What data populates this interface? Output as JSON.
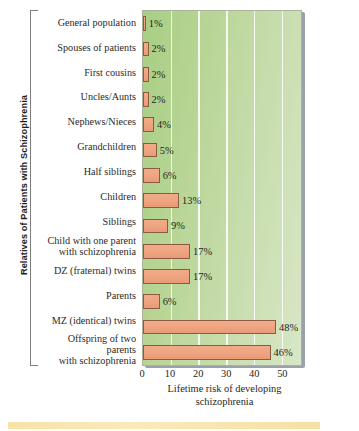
{
  "chart_data": {
    "type": "bar",
    "orientation": "horizontal",
    "title": "",
    "xlabel": "Lifetime risk of developing schizophrenia",
    "ylabel": "Relatives of Patients with Schizophrenia",
    "xlim": [
      0,
      57
    ],
    "xticks": [
      0,
      10,
      20,
      30,
      40,
      50
    ],
    "xtick_labels": [
      "0",
      "10",
      "20",
      "30",
      "40",
      "50"
    ],
    "grid": true,
    "legend": "none",
    "value_suffix": "%",
    "categories": [
      "General population",
      "Spouses of patients",
      "First cousins",
      "Uncles/Aunts",
      "Nephews/Nieces",
      "Grandchildren",
      "Half siblings",
      "Children",
      "Siblings",
      "Child with one parent\nwith schizophrenia",
      "DZ (fraternal) twins",
      "Parents",
      "MZ (identical) twins",
      "Offspring of two parents\nwith schizophrenia"
    ],
    "values": [
      1,
      2,
      2,
      2,
      4,
      5,
      6,
      13,
      9,
      17,
      17,
      6,
      48,
      46
    ],
    "value_labels": [
      "1%",
      "2%",
      "2%",
      "2%",
      "4%",
      "5%",
      "6%",
      "13%",
      "9%",
      "17%",
      "17%",
      "6%",
      "48%",
      "46%"
    ],
    "colors": {
      "bar_fill": "#eea481",
      "bar_edge": "#8a5a42",
      "plot_bg_left": "#a8ce84",
      "plot_bg_right": "#d8e7c6",
      "gridline": "#ffffff",
      "shadow": "#9aa0ac",
      "bottom_band": "#f7e2a8",
      "text": "#1f1f1f"
    }
  },
  "xaxis_title_lines": {
    "line1": "Lifetime risk of developing",
    "line2": "schizophrenia"
  }
}
